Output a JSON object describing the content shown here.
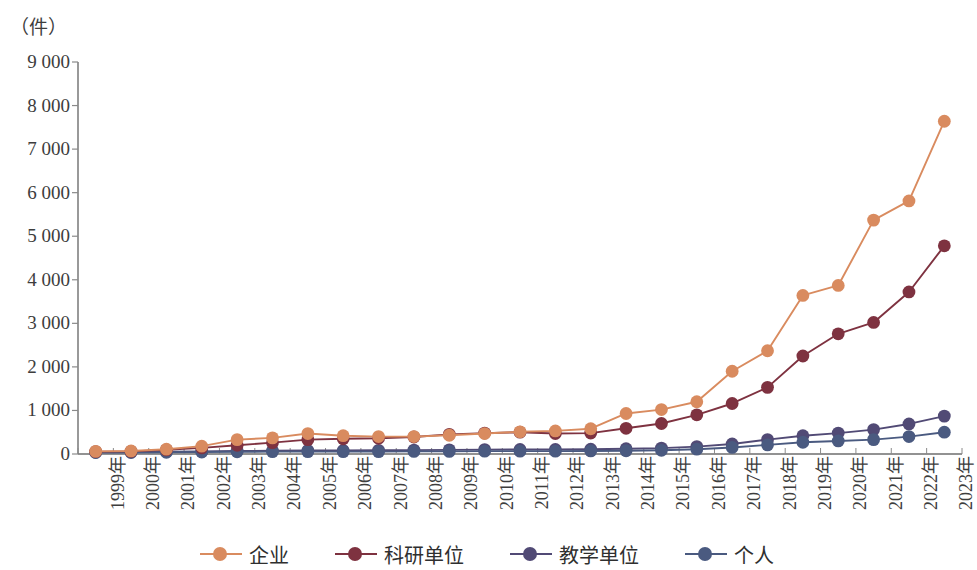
{
  "chart_data": {
    "type": "line",
    "title": "",
    "subtitle": "",
    "xlabel": "",
    "ylabel": "（件）",
    "unit_label": "（件）",
    "ylim": [
      0,
      9000
    ],
    "ytick_step": 1000,
    "yticks": [
      "0",
      "1 000",
      "2 000",
      "3 000",
      "4 000",
      "5 000",
      "6 000",
      "7 000",
      "8 000",
      "9 000"
    ],
    "ytick_values": [
      0,
      1000,
      2000,
      3000,
      4000,
      5000,
      6000,
      7000,
      8000,
      9000
    ],
    "grid": false,
    "legend_position": "bottom",
    "markers": "circle",
    "categories": [
      "1999年",
      "2000年",
      "2001年",
      "2002年",
      "2003年",
      "2004年",
      "2005年",
      "2006年",
      "2007年",
      "2008年",
      "2009年",
      "2010年",
      "2011年",
      "2012年",
      "2013年",
      "2014年",
      "2015年",
      "2016年",
      "2017年",
      "2018年",
      "2019年",
      "2020年",
      "2021年",
      "2022年",
      "2023年"
    ],
    "series": [
      {
        "name": "企业",
        "color": "#d98b5f",
        "values": [
          60,
          70,
          110,
          180,
          330,
          370,
          470,
          420,
          400,
          400,
          430,
          470,
          510,
          530,
          580,
          930,
          1020,
          1200,
          1900,
          2370,
          3640,
          3870,
          5370,
          5810,
          7640
        ]
      },
      {
        "name": "科研单位",
        "color": "#7e3240",
        "values": [
          55,
          60,
          95,
          140,
          200,
          260,
          330,
          350,
          360,
          390,
          450,
          480,
          500,
          470,
          480,
          590,
          700,
          900,
          1160,
          1530,
          2250,
          2760,
          3020,
          3720,
          4780
        ]
      },
      {
        "name": "教学单位",
        "color": "#514a75",
        "values": [
          40,
          45,
          55,
          60,
          70,
          75,
          80,
          80,
          85,
          90,
          95,
          100,
          105,
          105,
          110,
          120,
          135,
          170,
          230,
          330,
          420,
          480,
          560,
          690,
          870
        ]
      },
      {
        "name": "个人",
        "color": "#4a5a80",
        "values": [
          35,
          35,
          40,
          45,
          50,
          55,
          55,
          55,
          55,
          60,
          60,
          65,
          65,
          65,
          70,
          75,
          85,
          110,
          150,
          210,
          270,
          300,
          330,
          400,
          500
        ]
      }
    ]
  },
  "legend": {
    "items": [
      {
        "label": "企业"
      },
      {
        "label": "科研单位"
      },
      {
        "label": "教学单位"
      },
      {
        "label": "个人"
      }
    ]
  }
}
